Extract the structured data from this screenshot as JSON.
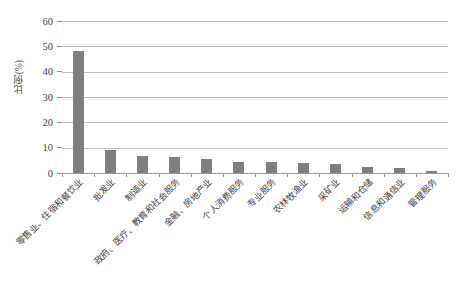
{
  "chart_data": {
    "type": "bar",
    "title": "",
    "xlabel": "",
    "ylabel": "比例(%)",
    "ylim": [
      0,
      60
    ],
    "ytick_labels": [
      "0",
      "10",
      "20",
      "30",
      "40",
      "50",
      "60"
    ],
    "ytick_values": [
      0,
      10,
      20,
      30,
      40,
      50,
      60
    ],
    "grid": true,
    "legend": false,
    "bar_color": "#7f7f7f",
    "categories": [
      "零售业、住宿和餐饮业",
      "批发业",
      "制造业",
      "政府、医疗、教育和社会服务",
      "金融、房地产业",
      "个人消费服务",
      "专业服务",
      "农林牧渔业",
      "采矿业",
      "运输和仓储",
      "信息和通信业",
      "管理服务"
    ],
    "values": [
      48,
      9,
      6.7,
      6.3,
      5.5,
      4.3,
      4.2,
      3.8,
      3.5,
      2.3,
      1.8,
      0.8
    ]
  }
}
